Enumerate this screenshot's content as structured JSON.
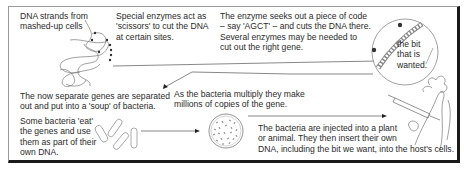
{
  "diagram": {
    "type": "process-flow",
    "steps": [
      {
        "id": "dna-strands",
        "text": "DNA strands from\nmashed-up cells"
      },
      {
        "id": "enzymes-scissors",
        "text": "Special enzymes act as\n'scissors' to cut the DNA\nat certain sites."
      },
      {
        "id": "enzyme-seeks",
        "text": "The enzyme seeks out a piece of code\n– say 'AGCT' – and cuts the DNA there.\nSeveral enzymes may be needed to\ncut out the right gene."
      },
      {
        "id": "bit-wanted",
        "text": "the bit\nthat is\nwanted."
      },
      {
        "id": "genes-separated",
        "text": "The now separate genes are separated\nout and put into a 'soup' of bacteria."
      },
      {
        "id": "bacteria-eat",
        "text": "Some bacteria 'eat'\nthe genes and use\nthem as part of their\nown DNA."
      },
      {
        "id": "bacteria-multiply",
        "text": "As the bacteria multiply they make\nmillions of copies of the gene."
      },
      {
        "id": "bacteria-injected",
        "text": "The bacteria are injected into a plant\nor animal. They then insert their own\nDNA, including the bit we want, into the host's cells."
      }
    ],
    "flow": [
      [
        "dna-strands",
        "bit-wanted"
      ],
      [
        "bit-wanted",
        "genes-separated"
      ],
      [
        "bacteria-eat",
        "bacteria-multiply"
      ],
      [
        "bacteria-multiply",
        "bacteria-injected"
      ]
    ]
  },
  "labels": {
    "dna_l1": "DNA strands from",
    "dna_l2": "mashed-up cells",
    "enz_l1": "Special enzymes act as",
    "enz_l2": "'scissors' to cut the DNA",
    "enz_l3": "at certain sites.",
    "seek_l1": "The enzyme seeks out a piece of code",
    "seek_l2": "– say 'AGCT' – and cuts the DNA there.",
    "seek_l3": "Several enzymes may be needed to",
    "seek_l4": "cut out the right gene.",
    "bit_l1": "the bit",
    "bit_l2": "that is",
    "bit_l3": "wanted.",
    "sep_l1": "The now separate genes are separated",
    "sep_l2": "out and put into a 'soup' of bacteria.",
    "eat_l1": "Some bacteria 'eat'",
    "eat_l2": "the genes and use",
    "eat_l3": "them as part of their",
    "eat_l4": "own DNA.",
    "mult_l1": "As the bacteria multiply they make",
    "mult_l2": "millions of copies of the gene.",
    "inj_l1": "The bacteria are injected into a plant",
    "inj_l2": "or animal. They then insert their own",
    "inj_l3": "DNA, including the bit we want, into the host's cells."
  },
  "colors": {
    "text": "#2a2a2a",
    "line": "#555555",
    "frame_shadow": "#1a1a1a",
    "frame_light": "#9a9a9a"
  }
}
